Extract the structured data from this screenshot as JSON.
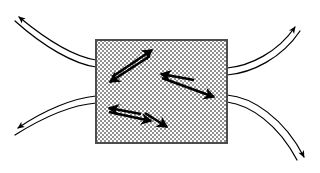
{
  "figure": {
    "title": "Flow deflection around a stippled region with internal counter-directed arrow pairs",
    "width": 320,
    "height": 173,
    "background_color": "#ffffff"
  },
  "colors": {
    "stroke": "#000000",
    "region_border": "#4d4d4d",
    "region_fill_light": "#ffffff",
    "region_fill_dark": "#8c8c8c",
    "region_fill_average": "#c8c8c8",
    "streamline": "#000000"
  },
  "region": {
    "label": "stippled-rectangle",
    "x": 95,
    "y": 39,
    "width": 133,
    "height": 105,
    "fill_pattern": "fine-checkerboard-stipple",
    "border_width": 2
  },
  "internal_arrows": [
    {
      "id": "pair-upper-left",
      "description": "two antiparallel arrows in the upper-left of the region",
      "arrows": [
        {
          "id": "upper-left-up-right",
          "direction": "up-right",
          "x1": 110,
          "y1": 75,
          "x2": 152,
          "y2": 49
        },
        {
          "id": "upper-left-down-left",
          "direction": "down-left",
          "x1": 150,
          "y1": 55,
          "x2": 107,
          "y2": 81
        }
      ]
    },
    {
      "id": "pair-middle-right",
      "description": "two antiparallel arrows in the middle-right of the region",
      "arrows": [
        {
          "id": "middle-right-left",
          "direction": "left",
          "x1": 195,
          "y1": 81,
          "x2": 160,
          "y2": 74
        },
        {
          "id": "middle-right-down-right",
          "direction": "down-right",
          "x1": 160,
          "y1": 77,
          "x2": 215,
          "y2": 97
        }
      ]
    },
    {
      "id": "pair-lower-left",
      "description": "two antiparallel arrows in the lower-left of the region",
      "arrows": [
        {
          "id": "lower-left-left",
          "direction": "left",
          "x1": 142,
          "y1": 115,
          "x2": 107,
          "y2": 108
        },
        {
          "id": "lower-left-right-down",
          "direction": "down-right",
          "x1": 107,
          "y1": 112,
          "x2": 152,
          "y2": 122
        },
        {
          "id": "lower-right-down-right",
          "direction": "down-right",
          "x1": 145,
          "y1": 112,
          "x2": 168,
          "y2": 128
        }
      ]
    }
  ],
  "streamlines": [
    {
      "id": "upper-left-outflow",
      "side": "left",
      "direction": "up-left",
      "arrowhead": true,
      "lines": 2,
      "tip_x": 16,
      "tip_y": 14
    },
    {
      "id": "lower-left-outflow",
      "side": "left",
      "direction": "down-left",
      "arrowhead": true,
      "lines": 2,
      "tip_x": 14,
      "tip_y": 131
    },
    {
      "id": "upper-right-outflow",
      "side": "right",
      "direction": "up-right",
      "arrowhead": true,
      "lines": 2,
      "tip_x": 298,
      "tip_y": 24
    },
    {
      "id": "lower-right-outflow",
      "side": "right",
      "direction": "down-right",
      "arrowhead": true,
      "lines": 2,
      "tip_x": 307,
      "tip_y": 160
    }
  ]
}
